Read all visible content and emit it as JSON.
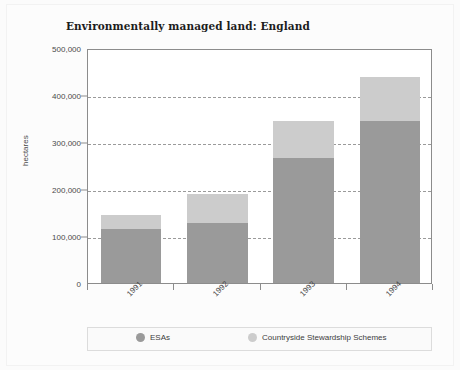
{
  "chart_data": {
    "type": "bar",
    "subtype": "stacked-vertical",
    "title": "Environmentally managed land: England",
    "xlabel": "",
    "ylabel": "hectares",
    "categories": [
      "1991",
      "1992",
      "1993",
      "1994"
    ],
    "series": [
      {
        "name": "ESAs",
        "color": "#9a9a9a",
        "values": [
          115000,
          128000,
          266000,
          344000
        ]
      },
      {
        "name": "Countryside Stewardship Schemes",
        "color": "#cccccc",
        "values": [
          30000,
          61000,
          79000,
          94000
        ]
      }
    ],
    "totals": [
      145000,
      189000,
      345000,
      438000
    ],
    "ylim": [
      0,
      500000
    ],
    "ytick_values": [
      0,
      100000,
      200000,
      300000,
      400000,
      500000
    ],
    "ytick_labels": [
      "0",
      "100,000",
      "200,000",
      "300,000",
      "400,000",
      "500,000"
    ],
    "grid": "horizontal-dashed",
    "legend_position": "bottom",
    "legend_entries": [
      "ESAs",
      "Countryside Stewardship Schemes"
    ],
    "xtick_label_rotation": -45
  },
  "figure": {
    "title": "Environmentally managed land: England",
    "y_axis_title": "hectares"
  },
  "axis": {
    "y_labels": [
      "500,000",
      "400,000",
      "300,000",
      "200,000",
      "100,000",
      "0"
    ],
    "x_labels": [
      "1991",
      "1992",
      "1993",
      "1994"
    ]
  },
  "legend": {
    "items": [
      {
        "label": "ESAs",
        "color": "#9a9a9a"
      },
      {
        "label": "Countryside Stewardship Schemes",
        "color": "#cccccc"
      }
    ]
  },
  "colors": {
    "esas": "#9a9a9a",
    "css": "#cccccc",
    "axis": "#8c8c8c",
    "grid": "#9a9a9a",
    "text": "#4a4a4a",
    "title": "#1d1d1d",
    "plot_bg": "#ffffff",
    "page_bg": "#fbfbfb"
  }
}
